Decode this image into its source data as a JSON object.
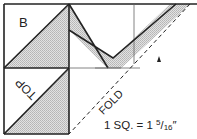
{
  "diagram": {
    "labels": {
      "piece_b": "B",
      "top": "TOP",
      "fold": "FOLD"
    },
    "scale": {
      "prefix": "1 SQ. = 1",
      "numerator": "5",
      "slash": "/",
      "denominator": "16",
      "unit": "″"
    },
    "colors": {
      "line": "#222222",
      "shade": "#cfcfcf",
      "background": "#ffffff"
    }
  }
}
